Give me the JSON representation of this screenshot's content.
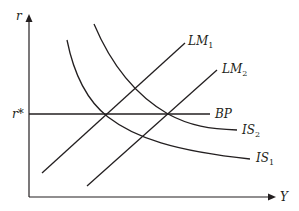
{
  "diagram": {
    "axes": {
      "y_label": "r",
      "x_label": "Y",
      "r_star_label": "r*"
    },
    "curves": {
      "LM1": {
        "label": "LM",
        "sub": "1"
      },
      "LM2": {
        "label": "LM",
        "sub": "2"
      },
      "BP": {
        "label": "BP"
      },
      "IS1": {
        "label": "IS",
        "sub": "1"
      },
      "IS2": {
        "label": "IS",
        "sub": "2"
      }
    },
    "colors": {
      "line": "#231f20",
      "background": "#ffffff"
    }
  }
}
